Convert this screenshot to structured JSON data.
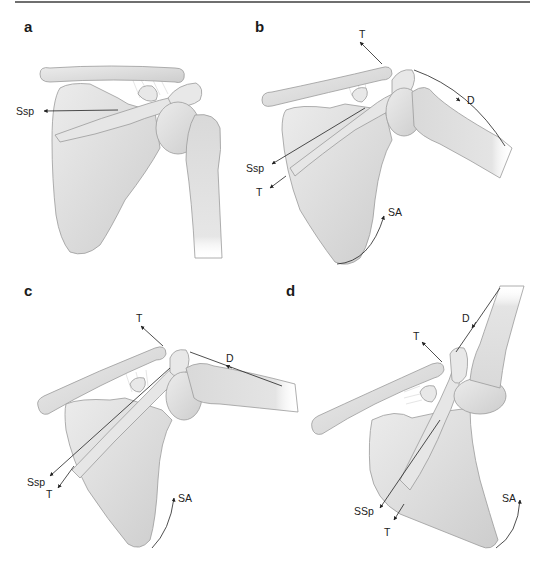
{
  "figure": {
    "colors": {
      "bone_fill": "#dedede",
      "bone_outline": "#9a9a9a",
      "label_text": "#222222",
      "rule_line": "#6f6f6f"
    },
    "panels": [
      {
        "id": "a",
        "letter": "a",
        "labels": {
          "ssp": "Ssp"
        }
      },
      {
        "id": "b",
        "letter": "b",
        "labels": {
          "t_top": "T",
          "d": "D",
          "ssp": "Ssp",
          "t_low": "T",
          "sa": "SA"
        }
      },
      {
        "id": "c",
        "letter": "c",
        "labels": {
          "t_top": "T",
          "d": "D",
          "ssp": "Ssp",
          "t_low": "T",
          "sa": "SA"
        }
      },
      {
        "id": "d",
        "letter": "d",
        "labels": {
          "t_top": "T",
          "d": "D",
          "ssp": "SSp",
          "t_low": "T",
          "sa": "SA"
        }
      }
    ]
  }
}
